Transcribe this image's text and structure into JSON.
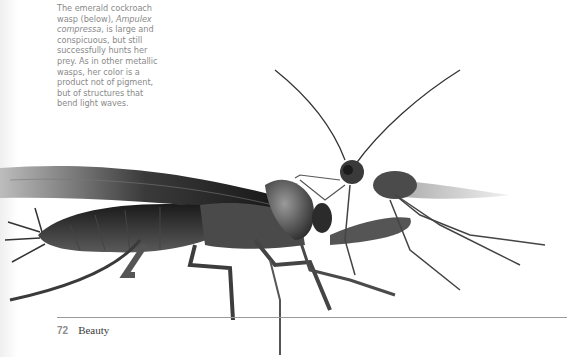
{
  "caption": {
    "lines": [
      "The emerald cockroach",
      "wasp (below), ",
      "Ampulex",
      "compressa",
      ", is large and",
      "conspicuous, but still",
      "successfully hunts her",
      "prey. As in other metallic",
      "wasps, her color is a",
      "product not of pigment,",
      "but of structures that",
      "bend light waves."
    ]
  },
  "illustration": {
    "subjects": [
      "cockroach",
      "emerald cockroach wasp"
    ],
    "colors": {
      "dark": "#1e1e1e",
      "mid": "#555555",
      "light": "#9a9a9a"
    }
  },
  "footer": {
    "page_number": "72",
    "running_head": "Beauty"
  }
}
